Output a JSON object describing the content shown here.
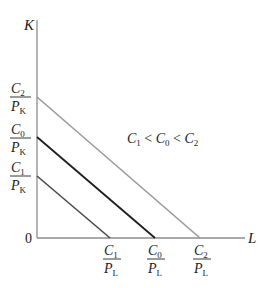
{
  "diagram": {
    "type": "isocost-lines",
    "axes": {
      "y_label": "K",
      "x_label": "L",
      "origin_label": "0",
      "color": "#8c8c8c"
    },
    "annotation": {
      "parts": [
        "C",
        "1",
        " < ",
        "C",
        "0",
        " < ",
        "C",
        "2"
      ],
      "text": "C1 < C0 < C2"
    },
    "lines": [
      {
        "name": "C1",
        "color": "#4a4a4a",
        "y_intercept_label": {
          "num": "C",
          "num_sub": "1",
          "den": "P",
          "den_sub": "K"
        },
        "x_intercept_label": {
          "num": "C",
          "num_sub": "1",
          "den": "P",
          "den_sub": "L"
        }
      },
      {
        "name": "C0",
        "color": "#1e1e1e",
        "y_intercept_label": {
          "num": "C",
          "num_sub": "0",
          "den": "P",
          "den_sub": "K"
        },
        "x_intercept_label": {
          "num": "C",
          "num_sub": "0",
          "den": "P",
          "den_sub": "L"
        }
      },
      {
        "name": "C2",
        "color": "#9a9a9a",
        "y_intercept_label": {
          "num": "C",
          "num_sub": "2",
          "den": "P",
          "den_sub": "K"
        },
        "x_intercept_label": {
          "num": "C",
          "num_sub": "2",
          "den": "P",
          "den_sub": "L"
        }
      }
    ]
  }
}
